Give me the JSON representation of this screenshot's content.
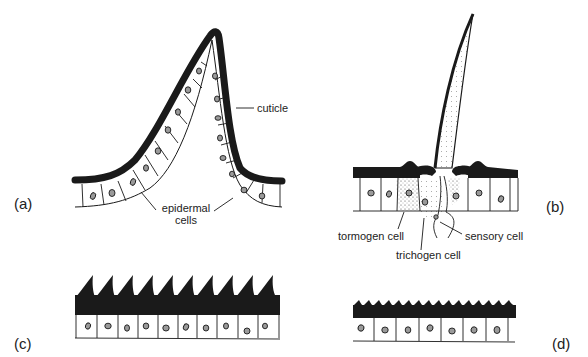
{
  "figure": {
    "panels": [
      {
        "id": "a",
        "label": "(a)",
        "description": "cuticular fold / evagination"
      },
      {
        "id": "b",
        "label": "(b)",
        "description": "seta (hair) with associated cells"
      },
      {
        "id": "c",
        "label": "(c)",
        "description": "large cuticular spines, 10 cells"
      },
      {
        "id": "d",
        "label": "(d)",
        "description": "small cuticular ridges, 7 cells"
      }
    ],
    "annotations": {
      "cuticle": "cuticle",
      "epidermal_line1": "epidermal",
      "epidermal_line2": "cells",
      "tormogen": "tormogen cell",
      "trichogen": "trichogen cell",
      "sensory": "sensory cell"
    },
    "colors": {
      "ink": "#1a1a1a",
      "background": "#ffffff",
      "nucleus_fill": "#9a9a9a",
      "stipple": "#bdbdbd"
    }
  }
}
